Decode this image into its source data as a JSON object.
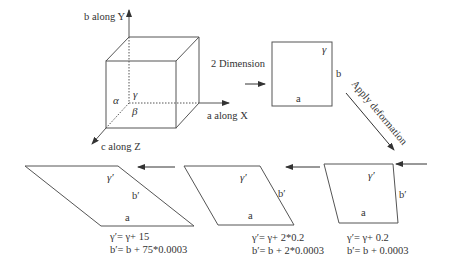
{
  "colors": {
    "line": "#555555",
    "text": "#333333",
    "background": "#ffffff"
  },
  "cube": {
    "axis_y_label": "b along Y",
    "axis_x_label": "a along X",
    "axis_z_label": "c along Z",
    "angle_alpha": "α",
    "angle_beta": "β",
    "angle_gamma": "γ"
  },
  "arrows": {
    "to_2d_label": "2 Dimension",
    "deformation_label": "Apply deformation"
  },
  "square": {
    "side_a": "a",
    "side_b": "b",
    "angle": "γ"
  },
  "stages": [
    {
      "name": "stage-1",
      "side_a": "a",
      "side_b": "b′",
      "angle": "γ′",
      "formula_gamma": "γ′= γ+ 0.2",
      "formula_b": "b′= b + 0.0003"
    },
    {
      "name": "stage-2",
      "side_a": "a",
      "side_b": "b′",
      "angle": "γ′",
      "formula_gamma": "γ′= γ+ 2*0.2",
      "formula_b": "b′= b + 2*0.0003"
    },
    {
      "name": "stage-75",
      "side_a": "a",
      "side_b": "b′",
      "angle": "γ′",
      "formula_gamma": "γ′= γ+ 15",
      "formula_b": "b′= b + 75*0.0003"
    }
  ]
}
